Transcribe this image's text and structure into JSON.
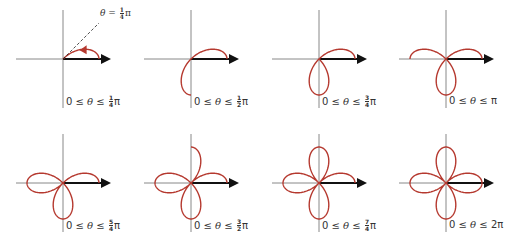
{
  "figure": {
    "curve": "r = cos 2θ",
    "colors": {
      "curve": "#b5392f",
      "axis": "#888888",
      "polar_axis": "#111111",
      "text": "#333333"
    },
    "scale_px": 36,
    "annotation": {
      "text_theta": "θ",
      "text_eq": " = ",
      "num": "1",
      "den": "4",
      "text_pi": "π"
    },
    "panels": [
      {
        "id": "p1",
        "cx": 63,
        "cy": 59,
        "theta_max_over_pi": 0.25,
        "label": {
          "prefix": "0 ≤ ",
          "theta": "θ",
          "mid": " ≤ ",
          "num": "1",
          "den": "4",
          "pi": "π",
          "whole": ""
        },
        "show_arrow": true,
        "show_ray": true
      },
      {
        "id": "p2",
        "cx": 191,
        "cy": 59,
        "theta_max_over_pi": 0.5,
        "label": {
          "prefix": "0 ≤ ",
          "theta": "θ",
          "mid": " ≤ ",
          "num": "1",
          "den": "2",
          "pi": "π",
          "whole": ""
        }
      },
      {
        "id": "p3",
        "cx": 319,
        "cy": 59,
        "theta_max_over_pi": 0.75,
        "label": {
          "prefix": "0 ≤ ",
          "theta": "θ",
          "mid": " ≤ ",
          "num": "3",
          "den": "4",
          "pi": "π",
          "whole": ""
        }
      },
      {
        "id": "p4",
        "cx": 446,
        "cy": 59,
        "theta_max_over_pi": 1.0,
        "label": {
          "prefix": "0 ≤ ",
          "theta": "θ",
          "mid": " ≤ ",
          "num": "",
          "den": "",
          "pi": "π",
          "whole": ""
        }
      },
      {
        "id": "p5",
        "cx": 63,
        "cy": 183,
        "theta_max_over_pi": 1.25,
        "label": {
          "prefix": "0 ≤ ",
          "theta": "θ",
          "mid": " ≤ ",
          "num": "5",
          "den": "4",
          "pi": "π",
          "whole": ""
        }
      },
      {
        "id": "p6",
        "cx": 191,
        "cy": 183,
        "theta_max_over_pi": 1.5,
        "label": {
          "prefix": "0 ≤ ",
          "theta": "θ",
          "mid": " ≤ ",
          "num": "3",
          "den": "2",
          "pi": "π",
          "whole": ""
        }
      },
      {
        "id": "p7",
        "cx": 319,
        "cy": 183,
        "theta_max_over_pi": 1.75,
        "label": {
          "prefix": "0 ≤ ",
          "theta": "θ",
          "mid": " ≤ ",
          "num": "7",
          "den": "4",
          "pi": "π",
          "whole": ""
        }
      },
      {
        "id": "p8",
        "cx": 446,
        "cy": 183,
        "theta_max_over_pi": 2.0,
        "label": {
          "prefix": "0 ≤ ",
          "theta": "θ",
          "mid": " ≤ ",
          "num": "",
          "den": "",
          "pi": "π",
          "whole": "2"
        }
      }
    ]
  }
}
